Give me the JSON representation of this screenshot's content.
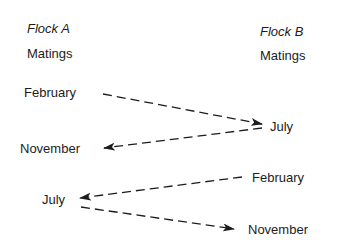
{
  "flock_a": {
    "title": "Flock A",
    "subtitle": "Matings",
    "months": [
      "February",
      "November",
      "July"
    ]
  },
  "flock_b": {
    "title": "Flock B",
    "subtitle": "Matings",
    "months": [
      "July",
      "February",
      "November"
    ]
  },
  "arrows": [
    {
      "from": "Flock A February",
      "to": "Flock B July",
      "style": "dashed"
    },
    {
      "from": "Flock B July",
      "to": "Flock A November",
      "style": "dashed"
    },
    {
      "from": "Flock B February",
      "to": "Flock A July",
      "style": "dashed"
    },
    {
      "from": "Flock A July",
      "to": "Flock B November",
      "style": "dashed"
    }
  ],
  "colors": {
    "ink": "#1c1c1c",
    "background": "#ffffff"
  }
}
